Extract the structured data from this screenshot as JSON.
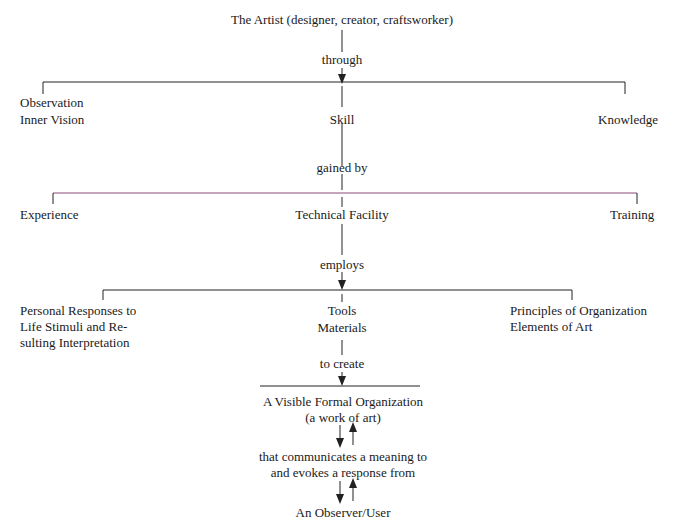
{
  "diagram": {
    "root": "The Artist (designer, creator, craftsworker)",
    "connector1": "through",
    "level1": {
      "left": [
        "Observation",
        "Inner Vision"
      ],
      "center": "Skill",
      "right": "Knowledge"
    },
    "connector2": "gained by",
    "level2": {
      "left": "Experience",
      "center": "Technical Facility",
      "right": "Training"
    },
    "connector3": "employs",
    "level3": {
      "left": [
        "Personal Responses to",
        "Life Stimuli and Re-",
        "sulting Interpretation"
      ],
      "center": [
        "Tools",
        "Materials"
      ],
      "right": [
        "Principles of Organization",
        "Elements of Art"
      ]
    },
    "connector4": "to create",
    "result": [
      "A Visible Formal Organization",
      "(a work of art)"
    ],
    "communication": [
      "that communicates a meaning to",
      "and evokes a response from"
    ],
    "audience": "An Observer/User",
    "colors": {
      "line": "#222222",
      "accent_line": "#8a4a7a"
    }
  }
}
